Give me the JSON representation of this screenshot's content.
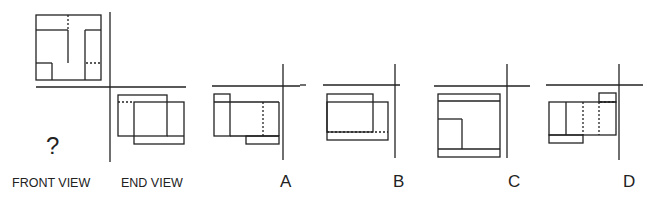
{
  "puzzle": {
    "question_mark": "?",
    "labels": {
      "front_view": "FRONT VIEW",
      "end_view": "END VIEW"
    },
    "options": [
      {
        "id": "A",
        "label": "A"
      },
      {
        "id": "B",
        "label": "B"
      },
      {
        "id": "C",
        "label": "C"
      },
      {
        "id": "D",
        "label": "D"
      }
    ]
  }
}
